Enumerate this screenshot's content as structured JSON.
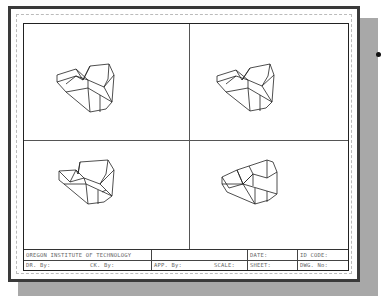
{
  "drawing": {
    "title_block": {
      "row1": {
        "institution": "OREGON INSTITUTE OF TECHNOLOGY",
        "blank": "",
        "date_label": "DATE:",
        "id_code_label": "ID CODE:"
      },
      "row2": {
        "drawn_by": "DR. By:",
        "checked_by": "CK. By:",
        "approved_by": "APP. By:",
        "scale_label": "SCALE:",
        "sheet_label": "SHEET:",
        "dwg_no": "DWG. No:"
      }
    },
    "viewports": [
      {
        "position": "top-left",
        "content": "isometric-wireframe-part"
      },
      {
        "position": "top-right",
        "content": "isometric-wireframe-part"
      },
      {
        "position": "bottom-left",
        "content": "isometric-wireframe-part"
      },
      {
        "position": "bottom-right",
        "content": "isometric-wireframe-part"
      }
    ]
  },
  "colors": {
    "frame": "#222222",
    "shadow": "#a8a8a8",
    "text": "#666666"
  }
}
